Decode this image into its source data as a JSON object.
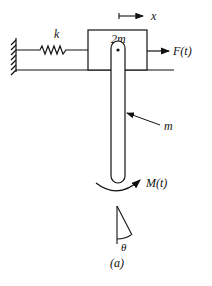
{
  "figure": {
    "caption": "(a)",
    "labels": {
      "spring": "k",
      "block_mass": "2m",
      "displacement": "x",
      "force": "F(t)",
      "pendulum_mass": "m",
      "moment": "M(t)",
      "angle": "θ"
    },
    "colors": {
      "stroke": "#111111",
      "background": "#ffffff"
    }
  }
}
